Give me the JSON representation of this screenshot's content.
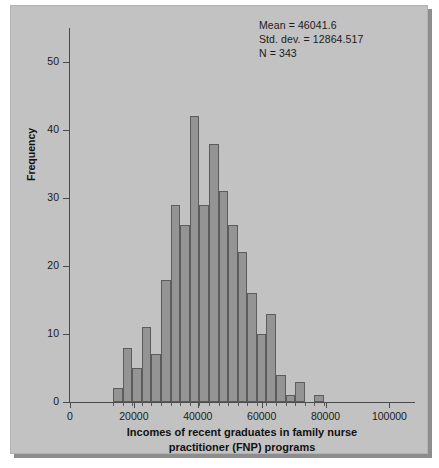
{
  "stats": {
    "mean_line": "Mean = 46041.6",
    "stddev_line": "Std. dev. = 12864.517",
    "n_line": "N = 343"
  },
  "colors": {
    "panel_background": "#c2c2c2",
    "bar_fill": "#949494",
    "bar_edge": "#5c5c5c",
    "axis": "#4a4a4a",
    "text": "#111111",
    "page_background": "#ffffff",
    "shadow": "#8d8d8d"
  },
  "chart_data": {
    "type": "bar",
    "title": "",
    "subtitle": "",
    "xlabel_line1": "Incomes of recent graduates in family nurse",
    "xlabel_line2": "practitioner (FNP) programs",
    "ylabel": "Frequency",
    "xlim": [
      0,
      108000
    ],
    "ylim": [
      0,
      55
    ],
    "xticks": [
      0,
      20000,
      40000,
      60000,
      80000,
      100000
    ],
    "xtick_labels": [
      "0",
      "20000",
      "40000",
      "60000",
      "80000",
      "100000"
    ],
    "yticks": [
      0,
      10,
      20,
      30,
      40,
      50
    ],
    "ytick_labels": [
      "0",
      "10",
      "20",
      "30",
      "40",
      "50"
    ],
    "grid": false,
    "legend": "none",
    "bin_width": 3000,
    "bin_starts": [
      13500,
      16500,
      19500,
      22500,
      25500,
      28500,
      31500,
      34500,
      37500,
      40500,
      43500,
      46500,
      49500,
      52500,
      55500,
      58500,
      61500,
      64500,
      67500,
      70500,
      76500
    ],
    "bin_centers": [
      15000,
      18000,
      21000,
      24000,
      27000,
      30000,
      33000,
      36000,
      39000,
      42000,
      45000,
      48000,
      51000,
      54000,
      57000,
      60000,
      63000,
      66000,
      69000,
      72000,
      78000
    ],
    "values": [
      2,
      8,
      5,
      11,
      7,
      18,
      29,
      26,
      42,
      29,
      38,
      31,
      26,
      22,
      16,
      10,
      13,
      4,
      1,
      3,
      1
    ],
    "annotations": [
      "Mean = 46041.6",
      "Std. dev. = 12864.517",
      "N = 343"
    ]
  }
}
